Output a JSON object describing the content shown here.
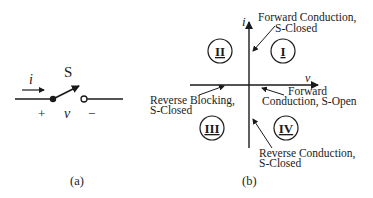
{
  "panel_a": {
    "caption": "(a)",
    "switch_label": "S",
    "current_label": "i",
    "voltage_label": "v",
    "plus_label": "+",
    "minus_label": "−"
  },
  "panel_b": {
    "caption": "(b)",
    "axis_y_label": "i",
    "axis_x_label": "v",
    "quadrants": {
      "q1": "I",
      "q2": "II",
      "q3": "III",
      "q4": "IV"
    },
    "annotations": {
      "forward_closed_l1": "Forward Conduction,",
      "forward_closed_l2": "S-Closed",
      "forward_open_l1": "Forward",
      "forward_open_l2": "Conduction, S-Open",
      "reverse_blocking_l1": "Reverse Blocking,",
      "reverse_blocking_l2": "S-Closed",
      "reverse_conduction_l1": "Reverse Conduction,",
      "reverse_conduction_l2": "S-Closed"
    }
  }
}
